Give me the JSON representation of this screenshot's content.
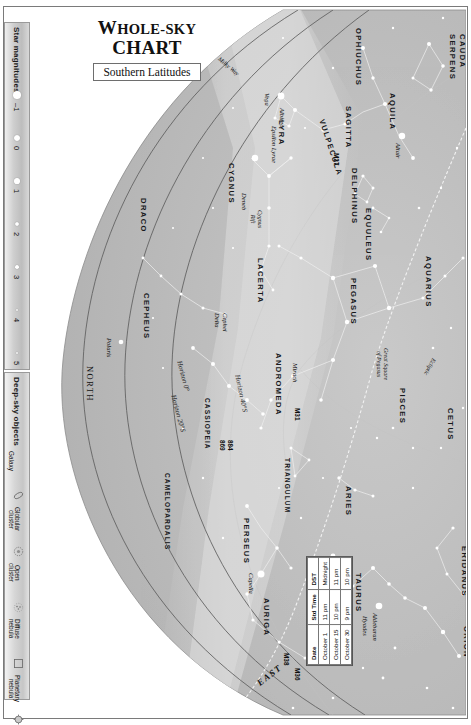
{
  "header": {
    "title_line1": "Whole-sky",
    "title_line2": "Chart",
    "subtitle": "Southern Latitudes"
  },
  "legend": {
    "magnitudes_title": "Star magnitudes",
    "magnitudes": [
      {
        "label": "–1",
        "size": 7.2
      },
      {
        "label": "0",
        "size": 6.2
      },
      {
        "label": "1",
        "size": 5.2
      },
      {
        "label": "2",
        "size": 4.3
      },
      {
        "label": "3",
        "size": 3.4
      },
      {
        "label": "4",
        "size": 2.6
      },
      {
        "label": "5",
        "size": 1.9
      }
    ],
    "deepsky_title": "Deep-sky objects",
    "deepsky": [
      {
        "label": "Galaxy",
        "icon": "galaxy-icon"
      },
      {
        "label": "Globular\ncluster",
        "icon": "globular-cluster-icon"
      },
      {
        "label": "Open\ncluster",
        "icon": "open-cluster-icon"
      },
      {
        "label": "Diffuse\nnebula",
        "icon": "diffuse-nebula-icon"
      },
      {
        "label": "Planetary\nnebula",
        "icon": "planetary-nebula-icon"
      }
    ]
  },
  "table": {
    "headers": [
      "Date",
      "Std Time",
      "DST"
    ],
    "rows": [
      [
        "October 1",
        "11 pm",
        "Midnight"
      ],
      [
        "October 15",
        "10 pm",
        "11 pm"
      ],
      [
        "October 30",
        "9 pm",
        "10 pm"
      ]
    ]
  },
  "cardinals": [
    {
      "label": "WEST",
      "x": 452,
      "y": 75,
      "rot": 90,
      "cls": "card"
    },
    {
      "label": "NORTH",
      "x": 62,
      "y": 358,
      "rot": 90,
      "cls": "cardn"
    },
    {
      "label": "EAST",
      "x": 222,
      "y": 672,
      "rot": -38,
      "cls": "card"
    },
    {
      "label": "Zenith",
      "x": 452,
      "y": 352,
      "rot": 90,
      "cls": "zen"
    }
  ],
  "constellations": [
    {
      "label": "SERPENS",
      "x": 424,
      "y": 26,
      "rot": 90
    },
    {
      "label": "CAUDA",
      "x": 434,
      "y": 26,
      "rot": 90
    },
    {
      "label": "OPHIUCHUS",
      "x": 330,
      "y": 20,
      "rot": 90
    },
    {
      "label": "AQUILA",
      "x": 364,
      "y": 85,
      "rot": 90
    },
    {
      "label": "SAGITTA",
      "x": 320,
      "y": 98,
      "rot": 90
    },
    {
      "label": "VULPECULA",
      "x": 293,
      "y": 110,
      "rot": 72
    },
    {
      "label": "LYRA",
      "x": 253,
      "y": 112,
      "rot": 90
    },
    {
      "label": "DELPHINUS",
      "x": 326,
      "y": 160,
      "rot": 90
    },
    {
      "label": "EQUULEUS",
      "x": 340,
      "y": 200,
      "rot": 90
    },
    {
      "label": "CYGNUS",
      "x": 203,
      "y": 155,
      "rot": 90
    },
    {
      "label": "DRACO",
      "x": 115,
      "y": 190,
      "rot": 90
    },
    {
      "label": "PEGASUS",
      "x": 325,
      "y": 270,
      "rot": 90
    },
    {
      "label": "AQUARIUS",
      "x": 400,
      "y": 248,
      "rot": 90
    },
    {
      "label": "LACERTA",
      "x": 232,
      "y": 250,
      "rot": 90
    },
    {
      "label": "CEPHEUS",
      "x": 118,
      "y": 285,
      "rot": 90
    },
    {
      "label": "ANDROMEDA",
      "x": 250,
      "y": 345,
      "rot": 90
    },
    {
      "label": "CASSIOPEIA",
      "x": 178,
      "y": 390,
      "rot": 90
    },
    {
      "label": "PISCES",
      "x": 374,
      "y": 380,
      "rot": 90
    },
    {
      "label": "CETUS",
      "x": 422,
      "y": 400,
      "rot": 90
    },
    {
      "label": "TRIANGULUM",
      "x": 258,
      "y": 450,
      "rot": 90
    },
    {
      "label": "ARIES",
      "x": 320,
      "y": 478,
      "rot": 90
    },
    {
      "label": "CAMELOPARDALIS",
      "x": 138,
      "y": 465,
      "rot": 90
    },
    {
      "label": "PERSEUS",
      "x": 218,
      "y": 510,
      "rot": 90
    },
    {
      "label": "TAURUS",
      "x": 330,
      "y": 565,
      "rot": 90
    },
    {
      "label": "AURIGA",
      "x": 238,
      "y": 590,
      "rot": 90
    },
    {
      "label": "ERIDANUS",
      "x": 436,
      "y": 538,
      "rot": 90
    },
    {
      "label": "ORION",
      "x": 438,
      "y": 618,
      "rot": 90
    }
  ],
  "stars": [
    {
      "label": "Vega",
      "x": 238,
      "y": 85
    },
    {
      "label": "Albireo",
      "x": 253,
      "y": 100
    },
    {
      "label": "Epsilon Lyrae",
      "x": 245,
      "y": 118
    },
    {
      "label": "Altair",
      "x": 369,
      "y": 135
    },
    {
      "label": "Deneb",
      "x": 215,
      "y": 185
    },
    {
      "label": "Polaris",
      "x": 80,
      "y": 330
    },
    {
      "label": "Delta",
      "x": 188,
      "y": 305
    },
    {
      "label": "Cephei",
      "x": 196,
      "y": 305
    },
    {
      "label": "Aldebaran",
      "x": 346,
      "y": 605
    },
    {
      "label": "Hyades",
      "x": 336,
      "y": 608
    },
    {
      "label": "Pleiades",
      "x": 300,
      "y": 560
    },
    {
      "label": "Capella",
      "x": 222,
      "y": 565
    },
    {
      "label": "Mirach",
      "x": 266,
      "y": 355
    }
  ],
  "deepsky_labels": [
    {
      "label": "M27",
      "x": 307,
      "y": 145
    },
    {
      "label": "M31",
      "x": 268,
      "y": 400
    },
    {
      "label": "869",
      "x": 193,
      "y": 432
    },
    {
      "label": "884",
      "x": 201,
      "y": 432
    },
    {
      "label": "M38",
      "x": 257,
      "y": 645
    },
    {
      "label": "M36",
      "x": 268,
      "y": 660
    }
  ],
  "features": [
    {
      "label": "Great Square\nof Pegasus",
      "x": 356,
      "y": 340,
      "rot": 90
    },
    {
      "label": "Cygnus\nRift",
      "x": 230,
      "y": 202,
      "rot": 90
    },
    {
      "label": "Ecliptic",
      "x": 404,
      "y": 352,
      "rot": 118
    },
    {
      "label": "Ecliptic",
      "x": 316,
      "y": 556,
      "rot": 118
    },
    {
      "label": "Milky Way",
      "x": 188,
      "y": 48,
      "rot": 40
    }
  ],
  "horizons": [
    {
      "label": "Horizon 0°",
      "x": 150,
      "y": 352,
      "rot": 75
    },
    {
      "label": "Horizon 20°S",
      "x": 144,
      "y": 386,
      "rot": 75
    },
    {
      "label": "Horizon 40°S",
      "x": 208,
      "y": 366,
      "rot": 78
    }
  ],
  "colors": {
    "sky_fill": "#b4b4b4",
    "sky_fill_light": "#d2d2d2",
    "star_color": "#ffffff",
    "border": "#7a7a7a"
  }
}
